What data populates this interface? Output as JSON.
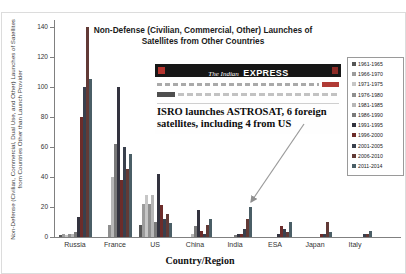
{
  "title": "Non-Defense (Civilian, Commercial, Other) Launches of Satellites from Other Countries",
  "axes": {
    "y_label": "Non-Defense (Civilian, Commercial, Dual Use, and Other) Launches of Satellites from Countries Other than Launch Provider",
    "x_label": "Country/Region"
  },
  "newspaper": {
    "masthead_prefix": "The Indian",
    "masthead_main": "EXPRESS",
    "headline": "ISRO launches ASTROSAT, 6 foreign satellites, including 4 from US"
  },
  "chart_data": {
    "type": "bar",
    "title": "Non-Defense (Civilian, Commercial, Other) Launches of Satellites from Other Countries",
    "xlabel": "Country/Region",
    "ylabel": "Non-Defense (Civilian, Commercial, Dual Use, and Other) Launches of Satellites from Countries Other than Launch Provider",
    "categories": [
      "Russia",
      "France",
      "US",
      "China",
      "India",
      "ESA",
      "Japan",
      "Italy"
    ],
    "ylim": [
      0,
      140
    ],
    "yticks": [
      0,
      20,
      40,
      60,
      80,
      100,
      120,
      140
    ],
    "grid": false,
    "legend_position": "right",
    "annotation": {
      "text": "ISRO launches ASTROSAT, 6 foreign satellites, including 4 from US",
      "points_to": {
        "category": "India",
        "series": "2011-2014"
      }
    },
    "series": [
      {
        "name": "1961-1965",
        "color": "#565656",
        "values": [
          1,
          0,
          8,
          0,
          0,
          0,
          0,
          0
        ]
      },
      {
        "name": "1966-1970",
        "color": "#9c9c9c",
        "values": [
          2,
          0,
          22,
          0,
          0,
          0,
          0,
          0
        ]
      },
      {
        "name": "1971-1975",
        "color": "#c6c6c6",
        "values": [
          1,
          0,
          28,
          0,
          0,
          0,
          0,
          0
        ]
      },
      {
        "name": "1976-1980",
        "color": "#8f8f8f",
        "values": [
          2,
          8,
          22,
          0,
          0,
          0,
          0,
          0
        ]
      },
      {
        "name": "1981-1985",
        "color": "#b7b7b7",
        "values": [
          2,
          40,
          28,
          2,
          0,
          0,
          0,
          0
        ]
      },
      {
        "name": "1986-1990",
        "color": "#7a7a7a",
        "values": [
          3,
          62,
          10,
          7,
          1,
          0,
          0,
          0
        ]
      },
      {
        "name": "1991-1995",
        "color": "#33333f",
        "values": [
          13,
          100,
          42,
          18,
          2,
          2,
          0,
          0
        ]
      },
      {
        "name": "1996-2000",
        "color": "#6d2c2a",
        "values": [
          80,
          38,
          21,
          4,
          2,
          7,
          2,
          0
        ]
      },
      {
        "name": "2001-2005",
        "color": "#39404d",
        "values": [
          100,
          60,
          12,
          2,
          5,
          5,
          2,
          2
        ]
      },
      {
        "name": "2006-2010",
        "color": "#623a36",
        "values": [
          140,
          45,
          15,
          8,
          12,
          3,
          10,
          2
        ]
      },
      {
        "name": "2011-2014",
        "color": "#4a5e66",
        "values": [
          105,
          55,
          9,
          12,
          20,
          10,
          3,
          4
        ]
      }
    ]
  }
}
